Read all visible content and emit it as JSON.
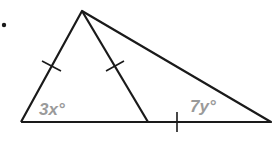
{
  "diagram": {
    "bullet": "•",
    "angle_labels": {
      "left_base_angle": "3x°",
      "right_base_angle": "7y°"
    },
    "colors": {
      "lines": "#1a1a1a",
      "labels": "#9a9a9a",
      "background": "#ffffff"
    }
  }
}
